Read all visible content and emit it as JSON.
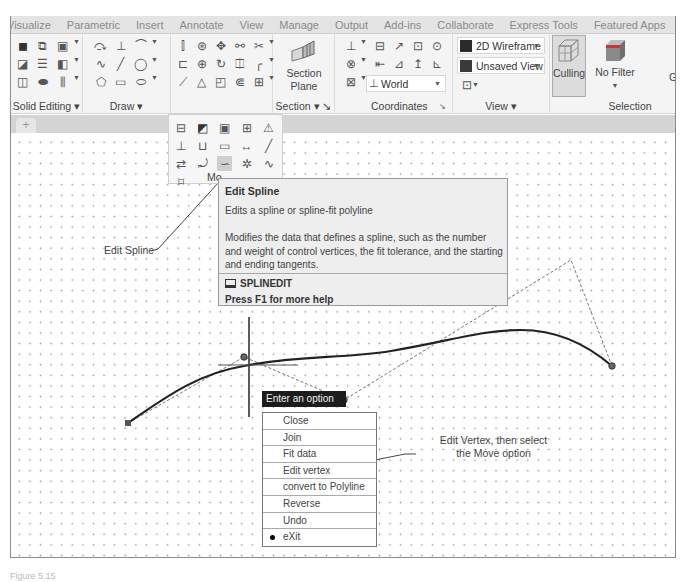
{
  "ribbon": {
    "tabs": [
      "Visualize",
      "Parametric",
      "Insert",
      "Annotate",
      "View",
      "Manage",
      "Output",
      "Add-ins",
      "Collaborate",
      "Express Tools",
      "Featured Apps"
    ],
    "more_icon": "panel-toggle-icon",
    "panels": {
      "solid_editing": {
        "title": "Solid Editing ▾"
      },
      "draw": {
        "title": "Draw ▾"
      },
      "section": {
        "title": "Section ▾ ↘",
        "button": "Section\nPlane",
        "button_line1": "Section",
        "button_line2": "Plane"
      },
      "coordinates": {
        "title": "Coordinates",
        "launcher": "↘",
        "ucs_combo": "World"
      },
      "view": {
        "title": "View ▾",
        "visual_style": "2D Wireframe",
        "named_view": "Unsaved View"
      },
      "selection": {
        "title": "Selection",
        "culling": "Culling",
        "filter": "No Filter",
        "cut_letter": "G"
      }
    }
  },
  "file_tabs": {
    "new_tab": "+"
  },
  "modify_menu": {
    "label": "Modify",
    "label_visible": "Mo",
    "selected_tool": "Edit Spline"
  },
  "tooltip": {
    "title": "Edit Spline",
    "subtitle": "Edits a spline or spline-fit polyline",
    "description": "Modifies the data that defines a spline, such as the number and weight of control vertices, the fit tolerance, and the starting and ending tangents.",
    "command": "SPLINEDIT",
    "help": "Press F1 for more help"
  },
  "prompt": {
    "label": "Enter an option"
  },
  "options": [
    {
      "label": "Close",
      "selected": false
    },
    {
      "label": "Join",
      "selected": false
    },
    {
      "label": "Fit data",
      "selected": false
    },
    {
      "label": "Edit vertex",
      "selected": false
    },
    {
      "label": "convert to Polyline",
      "selected": false
    },
    {
      "label": "Reverse",
      "selected": false
    },
    {
      "label": "Undo",
      "selected": false
    },
    {
      "label": "eXit",
      "selected": true
    }
  ],
  "callouts": {
    "edit_spline": "Edit Spline",
    "edit_vertex_line1": "Edit Vertex, then select",
    "edit_vertex_line2": "the Move option"
  },
  "caption": "Figure 5.15"
}
